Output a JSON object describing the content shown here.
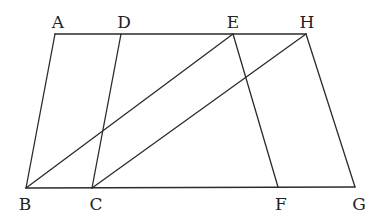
{
  "figure": {
    "points": [
      {
        "id": "A",
        "label": "A"
      },
      {
        "id": "D",
        "label": "D"
      },
      {
        "id": "E",
        "label": "E"
      },
      {
        "id": "H",
        "label": "H"
      },
      {
        "id": "B",
        "label": "B"
      },
      {
        "id": "C",
        "label": "C"
      },
      {
        "id": "F",
        "label": "F"
      },
      {
        "id": "G",
        "label": "G"
      }
    ],
    "segments": [
      [
        "A",
        "H"
      ],
      [
        "B",
        "G"
      ],
      [
        "A",
        "B"
      ],
      [
        "D",
        "C"
      ],
      [
        "E",
        "F"
      ],
      [
        "H",
        "G"
      ],
      [
        "B",
        "E"
      ],
      [
        "C",
        "H"
      ]
    ],
    "colors": {
      "line": "#2b2b2b",
      "label": "#222222",
      "background": "#ffffff"
    }
  }
}
